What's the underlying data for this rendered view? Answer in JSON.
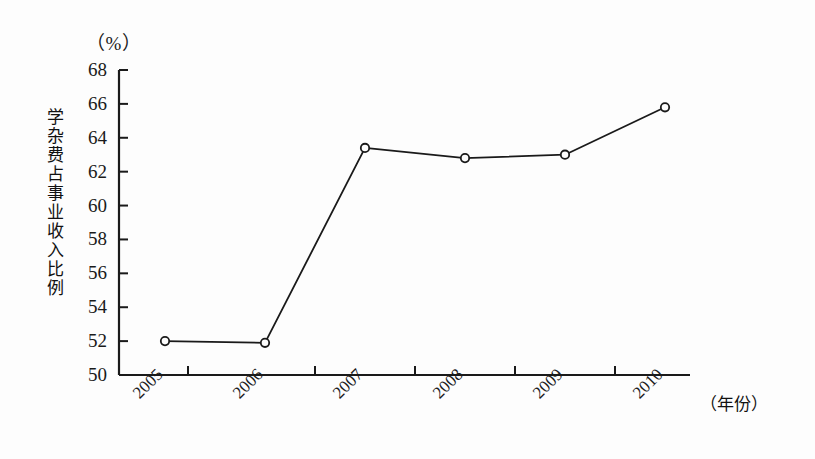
{
  "chart_data": {
    "type": "line",
    "title": "",
    "subtitle": "",
    "xlabel": "（年份）",
    "ylabel": "学杂费占事业收入比例",
    "yunit": "（%）",
    "categories": [
      "2005",
      "2006",
      "2007",
      "2008",
      "2009",
      "2010"
    ],
    "values": [
      52.0,
      51.9,
      63.4,
      62.8,
      63.0,
      65.8
    ],
    "series": [
      {
        "name": "学杂费占事业收入比例",
        "values": [
          52.0,
          51.9,
          63.4,
          62.8,
          63.0,
          65.8
        ]
      }
    ],
    "ylim": [
      50,
      68
    ],
    "yticks": [
      50,
      52,
      54,
      56,
      58,
      60,
      62,
      64,
      66,
      68
    ],
    "ytick_labels": [
      "50",
      "52",
      "54",
      "56",
      "58",
      "60",
      "62",
      "64",
      "66",
      "68"
    ],
    "grid": false,
    "legend": false,
    "legend_position": "none",
    "marker": "open-circle",
    "line_color": "#1a1a1a",
    "axis_color": "#1a1a1a",
    "background_color": "#fdfdfd"
  },
  "axes": {
    "y_unit_label": "（%）",
    "y_axis_title": "学杂费占事业收入比例",
    "x_unit_label": "（年份）"
  }
}
